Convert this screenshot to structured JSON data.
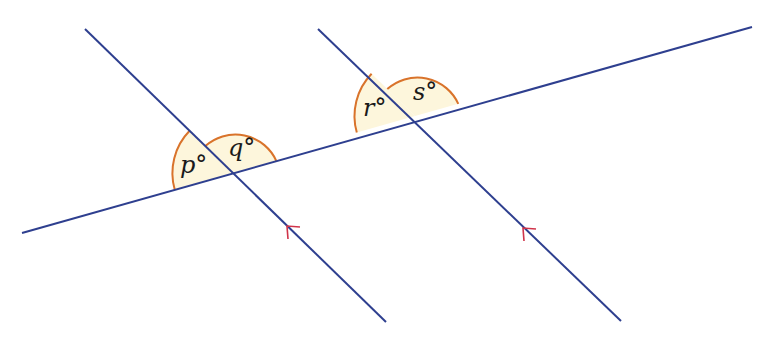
{
  "diagram": {
    "type": "parallel-lines-transversal",
    "colors": {
      "line": "#2e3f8f",
      "arc": "#d9732b",
      "fill": "#fdf6dc",
      "arrow": "#d0344a"
    },
    "angles": [
      {
        "id": "p",
        "label": "p°"
      },
      {
        "id": "q",
        "label": "q°"
      },
      {
        "id": "r",
        "label": "r°"
      },
      {
        "id": "s",
        "label": "s°"
      }
    ],
    "parallel_marker": "arrow"
  }
}
